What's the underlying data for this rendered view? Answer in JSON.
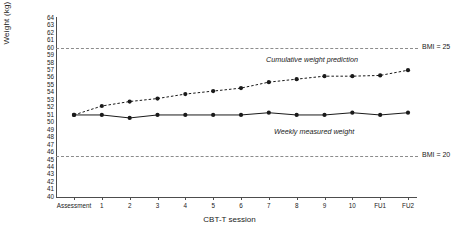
{
  "chart_data": {
    "type": "line",
    "title": "",
    "xlabel": "CBT-T session",
    "ylabel": "Weight (kg)",
    "x": [
      "Assessment",
      "1",
      "2",
      "3",
      "4",
      "5",
      "6",
      "7",
      "8",
      "9",
      "10",
      "FU1",
      "FU2"
    ],
    "ylim": [
      40,
      64
    ],
    "ytick_labels": [
      "64",
      "63",
      "62",
      "61",
      "60",
      "59",
      "58",
      "57",
      "56",
      "55",
      "54",
      "53",
      "52",
      "51",
      "50",
      "49",
      "48",
      "47",
      "46",
      "45",
      "44",
      "43",
      "42",
      "41",
      "40"
    ],
    "grid": false,
    "legend": "in-plot annotations",
    "series": [
      {
        "name": "Cumulative weight prediction",
        "style": "dashed",
        "marker": "filled-circle",
        "values": [
          51.0,
          52.2,
          52.8,
          53.2,
          53.8,
          54.2,
          54.6,
          55.4,
          55.8,
          56.2,
          56.2,
          56.3,
          57.0
        ]
      },
      {
        "name": "Weekly measured weight",
        "style": "solid",
        "marker": "filled-circle",
        "values": [
          51.0,
          51.0,
          50.6,
          51.0,
          51.0,
          51.0,
          51.0,
          51.3,
          51.0,
          51.0,
          51.3,
          51.0,
          51.3
        ]
      }
    ],
    "reference_lines": [
      {
        "label": "BMI = 25",
        "value": 60.0,
        "style": "dashed"
      },
      {
        "label": "BMI = 20",
        "value": 45.5,
        "style": "dashed"
      }
    ],
    "annotations": [
      {
        "text": "Cumulative weight prediction",
        "style": "italic"
      },
      {
        "text": "Weekly measured weight",
        "style": "italic"
      }
    ]
  },
  "colors": {
    "line": "#1a1a1a",
    "axis": "#4d4d4d",
    "reference": "#8c8c8c",
    "background": "#ffffff"
  }
}
